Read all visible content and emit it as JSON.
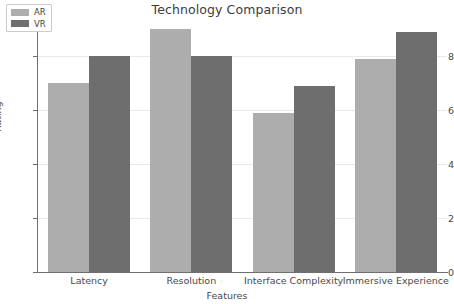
{
  "chart_data": {
    "type": "bar",
    "title": "Technology Comparison",
    "xlabel": "Features",
    "ylabel": "Rating",
    "categories": [
      "Latency",
      "Resolution",
      "Interface Complexity",
      "Immersive Experience"
    ],
    "series": [
      {
        "name": "AR",
        "color": "#adadad",
        "values": [
          7.0,
          9.0,
          5.9,
          7.9
        ]
      },
      {
        "name": "VR",
        "color": "#6e6e6e",
        "values": [
          8.0,
          8.0,
          6.9,
          8.9
        ]
      }
    ],
    "ylim": [
      0,
      9.4
    ],
    "yticks": [
      0,
      2,
      4,
      6,
      8
    ],
    "ytick_labels": [
      "0",
      "2",
      "4",
      "6",
      "8"
    ],
    "grid": "horizontal",
    "grid_color": "#e9e9e9",
    "legend_position": "upper left",
    "background": "#ffffff"
  },
  "legend": {
    "entries": [
      {
        "label": "AR"
      },
      {
        "label": "VR"
      }
    ]
  }
}
